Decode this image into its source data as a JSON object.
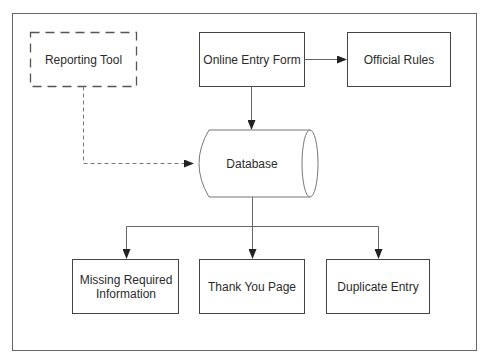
{
  "diagram": {
    "colors": {
      "stroke": "#555555",
      "text": "#2b2b2b",
      "background": "#ffffff",
      "frame": "#666666"
    },
    "nodes": {
      "reporting_tool": {
        "label": "Reporting Tool",
        "style": "dashed-box"
      },
      "online_entry_form": {
        "label": "Online Entry Form",
        "style": "box"
      },
      "official_rules": {
        "label": "Official Rules",
        "style": "box"
      },
      "database": {
        "label": "Database",
        "style": "cylinder"
      },
      "missing_info": {
        "label": "Missing Required Information",
        "style": "box"
      },
      "thank_you": {
        "label": "Thank You Page",
        "style": "box"
      },
      "duplicate": {
        "label": "Duplicate Entry",
        "style": "box"
      }
    },
    "edges": [
      {
        "from": "Online Entry Form",
        "to": "Official Rules",
        "style": "solid"
      },
      {
        "from": "Online Entry Form",
        "to": "Database",
        "style": "solid"
      },
      {
        "from": "Reporting Tool",
        "to": "Database",
        "style": "dashed"
      },
      {
        "from": "Database",
        "to": "Missing Required Information",
        "style": "solid"
      },
      {
        "from": "Database",
        "to": "Thank You Page",
        "style": "solid"
      },
      {
        "from": "Database",
        "to": "Duplicate Entry",
        "style": "solid"
      }
    ]
  }
}
